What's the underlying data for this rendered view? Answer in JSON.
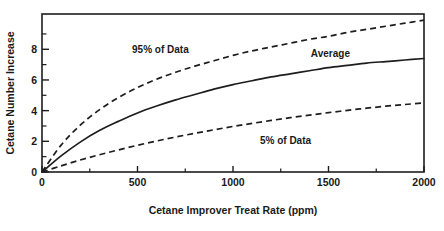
{
  "chart_data": {
    "type": "line",
    "title": "",
    "xlabel": "Cetane Improver Treat Rate (ppm)",
    "ylabel": "Cetane Number Increase",
    "xlim": [
      0,
      2000
    ],
    "ylim": [
      0,
      10.3
    ],
    "grid": false,
    "legend_position": "inline-annotations",
    "x_ticks": [
      0,
      500,
      1000,
      1500,
      2000
    ],
    "x_tick_labels": [
      "0",
      "500",
      "1000",
      "1500",
      "2000"
    ],
    "x_minor_tick_step": 250,
    "y_ticks": [
      0,
      2,
      4,
      6,
      8
    ],
    "y_tick_labels": [
      "0",
      "2",
      "4",
      "6",
      "8"
    ],
    "y_minor_tick_step": 1,
    "x": [
      0,
      100,
      200,
      300,
      400,
      500,
      600,
      700,
      800,
      900,
      1000,
      1100,
      1200,
      1300,
      1400,
      1500,
      1600,
      1700,
      1800,
      1900,
      2000
    ],
    "series": [
      {
        "name": "95% of Data",
        "style": "dashed",
        "color": "#1d1d1d",
        "label_text": "95% of Data",
        "label_x": 620,
        "label_y": 8.0,
        "values": [
          0.0,
          1.75,
          3.05,
          4.05,
          4.85,
          5.5,
          6.05,
          6.5,
          6.9,
          7.25,
          7.6,
          7.9,
          8.15,
          8.4,
          8.65,
          8.85,
          9.1,
          9.3,
          9.5,
          9.7,
          9.9
        ]
      },
      {
        "name": "Average",
        "style": "solid",
        "color": "#1d1d1d",
        "label_text": "Average",
        "label_x": 1510,
        "label_y": 7.75,
        "values": [
          0.0,
          1.05,
          1.95,
          2.7,
          3.3,
          3.85,
          4.3,
          4.7,
          5.05,
          5.4,
          5.7,
          5.95,
          6.2,
          6.4,
          6.6,
          6.8,
          6.95,
          7.1,
          7.2,
          7.3,
          7.4
        ]
      },
      {
        "name": "5% of Data",
        "style": "dashed",
        "color": "#1d1d1d",
        "label_text": "5% of Data",
        "label_x": 1275,
        "label_y": 2.05,
        "values": [
          0.0,
          0.4,
          0.78,
          1.12,
          1.44,
          1.74,
          2.02,
          2.28,
          2.52,
          2.75,
          2.97,
          3.17,
          3.36,
          3.54,
          3.71,
          3.87,
          4.02,
          4.16,
          4.29,
          4.4,
          4.5
        ]
      }
    ]
  },
  "colors": {
    "ink": "#1d1d1d",
    "background": "#ffffff"
  }
}
